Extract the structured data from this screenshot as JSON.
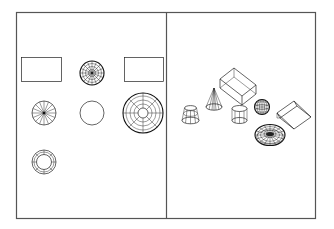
{
  "diagram": {
    "type": "cad-viewports",
    "colors": {
      "background": "#ffffff",
      "frame": "#555555",
      "line": "#222222"
    },
    "viewports": [
      {
        "id": "top-view",
        "label": "",
        "objects": [
          {
            "shape": "box",
            "view": "plan"
          },
          {
            "shape": "sphere",
            "view": "plan"
          },
          {
            "shape": "wedge",
            "view": "plan"
          },
          {
            "shape": "cone",
            "view": "plan"
          },
          {
            "shape": "cylinder",
            "view": "plan"
          },
          {
            "shape": "dome",
            "view": "plan"
          },
          {
            "shape": "torus",
            "view": "plan"
          }
        ]
      },
      {
        "id": "isometric-view",
        "label": "",
        "objects": [
          {
            "shape": "box",
            "view": "isometric"
          },
          {
            "shape": "cone",
            "view": "isometric"
          },
          {
            "shape": "frustum",
            "view": "isometric"
          },
          {
            "shape": "cylinder",
            "view": "isometric"
          },
          {
            "shape": "sphere",
            "view": "isometric"
          },
          {
            "shape": "wedge",
            "view": "isometric"
          },
          {
            "shape": "torus",
            "view": "isometric"
          }
        ]
      }
    ]
  }
}
